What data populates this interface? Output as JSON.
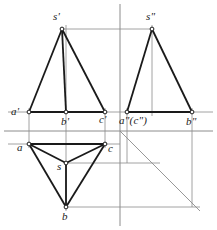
{
  "figure": {
    "kind": "descriptive-geometry-three-view-projection",
    "canvas": {
      "width": 217,
      "height": 230
    },
    "colors": {
      "background": "#ffffff",
      "object_line": "#1a1a1a",
      "projection_line": "#8c8c8c",
      "axis_line": "#8c8c8c",
      "miter_line": "#8c8c8c",
      "vertex_fill": "#ffffff",
      "vertex_stroke": "#1a1a1a",
      "label_text": "#1a1a1a"
    },
    "axes": {
      "vertical_x": 120,
      "vertical_y1": 4,
      "vertical_y2": 226,
      "horizontal_y": 131,
      "horizontal_x1": 4,
      "horizontal_x2": 213
    },
    "miter_line": {
      "x1": 120,
      "y1": 131,
      "x2": 200,
      "y2": 211
    },
    "views": {
      "front": {
        "name": "front-view",
        "apex": {
          "label": "s'",
          "x": 62,
          "y": 29
        },
        "base": [
          {
            "label": "a'",
            "x": 29,
            "y": 112
          },
          {
            "label": "b'",
            "x": 66,
            "y": 112
          },
          {
            "label": "c'",
            "x": 105,
            "y": 112
          }
        ]
      },
      "side": {
        "name": "side-view",
        "apex": {
          "label": "s\"",
          "x": 152,
          "y": 29
        },
        "base": [
          {
            "label": "a\"(c\")",
            "x": 127,
            "y": 112
          },
          {
            "label": "b\"",
            "x": 192,
            "y": 112
          }
        ]
      },
      "top": {
        "name": "top-view",
        "center": {
          "label": "s",
          "x": 66,
          "y": 163
        },
        "vertices": [
          {
            "label": "a",
            "x": 29,
            "y": 144
          },
          {
            "label": "c",
            "x": 105,
            "y": 144
          },
          {
            "label": "b",
            "x": 66,
            "y": 207
          }
        ]
      }
    },
    "labels": [
      {
        "name": "label-s-prime",
        "text": "s'",
        "x": 53,
        "y": 11
      },
      {
        "name": "label-s-double-prime",
        "text": "s\"",
        "x": 146,
        "y": 11
      },
      {
        "name": "label-a-prime",
        "text": "a'",
        "x": 11,
        "y": 106
      },
      {
        "name": "label-b-prime",
        "text": "b'",
        "x": 61,
        "y": 116
      },
      {
        "name": "label-c-prime",
        "text": "c'",
        "x": 99,
        "y": 114
      },
      {
        "name": "label-a-c-double-prime",
        "text": "a\"(c\")",
        "x": 119,
        "y": 115
      },
      {
        "name": "label-b-double-prime",
        "text": "b\"",
        "x": 186,
        "y": 116
      },
      {
        "name": "label-a",
        "text": "a",
        "x": 17,
        "y": 142
      },
      {
        "name": "label-c",
        "text": "c",
        "x": 108,
        "y": 143
      },
      {
        "name": "label-s",
        "text": "s",
        "x": 57,
        "y": 161
      },
      {
        "name": "label-b",
        "text": "b",
        "x": 62,
        "y": 211
      }
    ]
  }
}
